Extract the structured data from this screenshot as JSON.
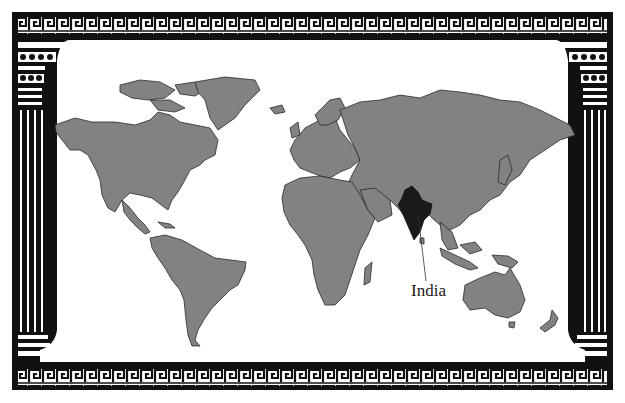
{
  "map": {
    "title": "World map highlighting India",
    "highlight_country": "India",
    "label": "India",
    "colors": {
      "frame": "#111111",
      "frame_inner": "#ffffff",
      "land": "#828282",
      "border": "#2a2a2a",
      "highlight": "#1a1a1a",
      "water": "#ffffff"
    },
    "frame": {
      "style": "Greek key border with classical columns",
      "top_band": "greek-key",
      "bottom_band": "greek-key",
      "left_column": "fluted column with capital and base",
      "right_column": "fluted column with capital and base"
    }
  }
}
